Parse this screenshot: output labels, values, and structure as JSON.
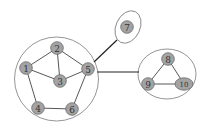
{
  "diagram": {
    "type": "graph",
    "groups": [
      {
        "id": "group-a",
        "members": [
          "1",
          "2",
          "3",
          "4",
          "5",
          "6"
        ],
        "shape": "circle",
        "cx": 56.5,
        "cy": 79,
        "r": 42
      },
      {
        "id": "group-b",
        "members": [
          "7"
        ],
        "shape": "ellipse",
        "cx": 128,
        "cy": 27,
        "rx": 12,
        "ry": 17,
        "rotate": 25
      },
      {
        "id": "group-c",
        "members": [
          "8",
          "9",
          "10"
        ],
        "shape": "ellipse",
        "cx": 167,
        "cy": 74,
        "rx": 29,
        "ry": 25
      }
    ],
    "nodes": [
      {
        "id": "1",
        "label": "1",
        "x": 26,
        "y": 68
      },
      {
        "id": "2",
        "label": "2",
        "x": 57,
        "y": 48
      },
      {
        "id": "3",
        "label": "3",
        "x": 60,
        "y": 81
      },
      {
        "id": "4",
        "label": "4",
        "x": 38,
        "y": 108
      },
      {
        "id": "5",
        "label": "5",
        "x": 88,
        "y": 69
      },
      {
        "id": "6",
        "label": "6",
        "x": 72,
        "y": 109
      },
      {
        "id": "7",
        "label": "7",
        "x": 127,
        "y": 27
      },
      {
        "id": "8",
        "label": "8",
        "x": 168,
        "y": 59
      },
      {
        "id": "9",
        "label": "9",
        "x": 148,
        "y": 84
      },
      {
        "id": "10",
        "label": "10",
        "x": 184,
        "y": 84
      }
    ],
    "edges": [
      [
        "1",
        "2"
      ],
      [
        "1",
        "3"
      ],
      [
        "2",
        "3"
      ],
      [
        "2",
        "5"
      ],
      [
        "3",
        "5"
      ],
      [
        "1",
        "4"
      ],
      [
        "4",
        "6"
      ],
      [
        "6",
        "5"
      ],
      [
        "8",
        "9"
      ],
      [
        "8",
        "10"
      ],
      [
        "9",
        "10"
      ]
    ],
    "group_links": [
      {
        "from": "group-a",
        "to": "group-b",
        "x1": 94,
        "y1": 62,
        "x2": 117,
        "y2": 40
      },
      {
        "from": "group-a",
        "to": "group-c",
        "x1": 97,
        "y1": 72,
        "x2": 139,
        "y2": 72
      }
    ]
  }
}
